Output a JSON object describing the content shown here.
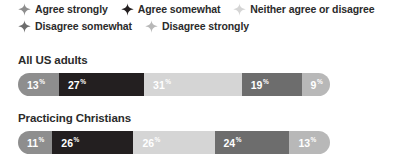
{
  "legend": {
    "rows": [
      [
        {
          "label": "Agree strongly",
          "color": "#8e8e8e",
          "marker": "sparkle-icon"
        },
        {
          "label": "Agree somewhat",
          "color": "#231f20",
          "marker": "sparkle-icon"
        },
        {
          "label": "Neither agree or disagree",
          "color": "#d5d5d5",
          "marker": "sparkle-icon"
        }
      ],
      [
        {
          "label": "Disagree somewhat",
          "color": "#6d6d6d",
          "marker": "sparkle-icon"
        },
        {
          "label": "Disagree strongly",
          "color": "#b8b8b8",
          "marker": "sparkle-icon"
        }
      ]
    ]
  },
  "chart_data": {
    "type": "bar",
    "title": "",
    "xlabel": "",
    "ylabel": "",
    "orientation": "horizontal",
    "stacked": true,
    "units": "percent",
    "xlim": [
      0,
      100
    ],
    "grid": false,
    "legend_position": "top",
    "categories": [
      "All US adults",
      "Practicing Christians"
    ],
    "series": [
      {
        "name": "Agree strongly",
        "color": "#8e8e8e",
        "text_color": "#ffffff",
        "values": [
          13,
          11
        ]
      },
      {
        "name": "Agree somewhat",
        "color": "#231f20",
        "text_color": "#ffffff",
        "values": [
          27,
          26
        ]
      },
      {
        "name": "Neither agree or disagree",
        "color": "#d5d5d5",
        "text_color": "#ffffff",
        "values": [
          31,
          26
        ]
      },
      {
        "name": "Disagree somewhat",
        "color": "#6d6d6d",
        "text_color": "#ffffff",
        "values": [
          19,
          24
        ]
      },
      {
        "name": "Disagree strongly",
        "color": "#b8b8b8",
        "text_color": "#ffffff",
        "values": [
          9,
          13
        ]
      }
    ],
    "groups": [
      {
        "label": "All US adults",
        "segments": [
          {
            "series": "Agree strongly",
            "value": "13",
            "suffix": "%",
            "color": "#8e8e8e",
            "text_color": "#ffffff"
          },
          {
            "series": "Agree somewhat",
            "value": "27",
            "suffix": "%",
            "color": "#231f20",
            "text_color": "#ffffff"
          },
          {
            "series": "Neither agree or disagree",
            "value": "31",
            "suffix": "%",
            "color": "#d5d5d5",
            "text_color": "#ffffff"
          },
          {
            "series": "Disagree somewhat",
            "value": "19",
            "suffix": "%",
            "color": "#6d6d6d",
            "text_color": "#ffffff"
          },
          {
            "series": "Disagree strongly",
            "value": "9",
            "suffix": "%",
            "color": "#b8b8b8",
            "text_color": "#ffffff"
          }
        ]
      },
      {
        "label": "Practicing Christians",
        "segments": [
          {
            "series": "Agree strongly",
            "value": "11",
            "suffix": "%",
            "color": "#8e8e8e",
            "text_color": "#ffffff"
          },
          {
            "series": "Agree somewhat",
            "value": "26",
            "suffix": "%",
            "color": "#231f20",
            "text_color": "#ffffff"
          },
          {
            "series": "Neither agree or disagree",
            "value": "26",
            "suffix": "%",
            "color": "#d5d5d5",
            "text_color": "#ffffff"
          },
          {
            "series": "Disagree somewhat",
            "value": "24",
            "suffix": "%",
            "color": "#6d6d6d",
            "text_color": "#ffffff"
          },
          {
            "series": "Disagree strongly",
            "value": "13",
            "suffix": "%",
            "color": "#b8b8b8",
            "text_color": "#ffffff"
          }
        ]
      }
    ]
  }
}
